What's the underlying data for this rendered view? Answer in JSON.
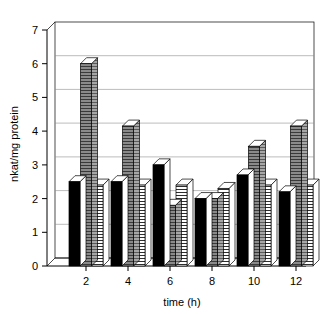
{
  "chart_data": {
    "type": "bar",
    "title": "",
    "subtitle": "",
    "xlabel": "time (h)",
    "ylabel": "nkat/mg protein",
    "categories": [
      "2",
      "4",
      "6",
      "8",
      "10",
      "12"
    ],
    "x": [
      2,
      4,
      6,
      8,
      10,
      12
    ],
    "series": [
      {
        "name": "series-1",
        "style": "solid-black",
        "color": "#000000",
        "values": [
          2.5,
          2.5,
          3.0,
          2.0,
          2.7,
          2.2
        ]
      },
      {
        "name": "series-2",
        "style": "gray-horizontal-hatch",
        "color": "#808080",
        "values": [
          6.0,
          4.15,
          1.8,
          2.0,
          3.55,
          4.15
        ]
      },
      {
        "name": "series-3",
        "style": "white-horizontal-hatch",
        "color": "#ffffff",
        "values": [
          2.4,
          2.4,
          2.4,
          2.3,
          2.4,
          2.4
        ]
      }
    ],
    "ylim": [
      0,
      7
    ],
    "yticks": [
      0,
      1,
      2,
      3,
      4,
      5,
      6,
      7
    ],
    "ytick_labels": [
      "0",
      "1",
      "2",
      "3",
      "4",
      "5",
      "6",
      "7"
    ],
    "xtick_labels": [
      "2",
      "4",
      "6",
      "8",
      "10",
      "12"
    ],
    "grid": true,
    "grid_axis": "y",
    "legend": "none",
    "legend_position": "none",
    "three_d_effect": true,
    "annotations": []
  },
  "colors": {
    "background": "#ffffff",
    "axis": "#000000",
    "grid": "#8d8d8d",
    "series_1": "#000000",
    "series_2": "#808080",
    "series_3": "#ffffff"
  }
}
